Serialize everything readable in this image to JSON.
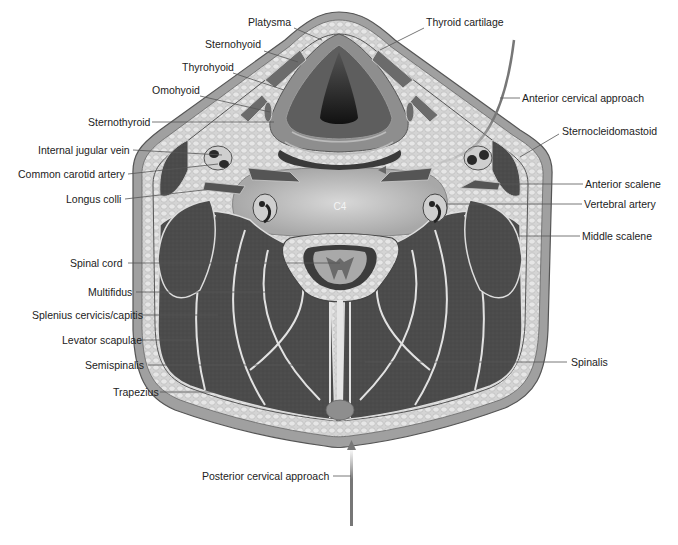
{
  "figure": {
    "vertebral_level": "C4",
    "colors": {
      "background": "#ffffff",
      "skin": "#9e9e9e",
      "fat": "#d6d6d6",
      "muscle": "#4a4a4a",
      "fascia": "#e8e8e8",
      "bone": "#c4c4c4",
      "cord": "#7a7a7a",
      "leader_line": "#555555",
      "label_text": "#222222"
    },
    "labels_left": [
      {
        "text": "Platysma",
        "x": 248,
        "y": 22
      },
      {
        "text": "Sternohyoid",
        "x": 205,
        "y": 44
      },
      {
        "text": "Thyrohyoid",
        "x": 182,
        "y": 67
      },
      {
        "text": "Omohyoid",
        "x": 152,
        "y": 90
      },
      {
        "text": "Sternothyroid",
        "x": 88,
        "y": 122
      },
      {
        "text": "Internal jugular vein",
        "x": 38,
        "y": 150
      },
      {
        "text": "Common carotid artery",
        "x": 18,
        "y": 174
      },
      {
        "text": "Longus colli",
        "x": 66,
        "y": 199
      },
      {
        "text": "Spinal cord",
        "x": 70,
        "y": 263
      },
      {
        "text": "Multifidus",
        "x": 88,
        "y": 292
      },
      {
        "text": "Splenius cervicis/capitis",
        "x": 32,
        "y": 315
      },
      {
        "text": "Levator scapulae",
        "x": 62,
        "y": 340
      },
      {
        "text": "Semispinalis",
        "x": 85,
        "y": 365
      },
      {
        "text": "Trapezius",
        "x": 113,
        "y": 392
      },
      {
        "text": "Posterior cervical approach",
        "x": 202,
        "y": 475
      }
    ],
    "labels_right": [
      {
        "text": "Thyroid cartilage",
        "x": 426,
        "y": 22
      },
      {
        "text": "Anterior cervical approach",
        "x": 522,
        "y": 98
      },
      {
        "text": "Sternocleidomastoid",
        "x": 562,
        "y": 131
      },
      {
        "text": "Anterior scalene",
        "x": 585,
        "y": 184
      },
      {
        "text": "Vertebral artery",
        "x": 584,
        "y": 204
      },
      {
        "text": "Middle scalene",
        "x": 582,
        "y": 236
      },
      {
        "text": "Spinalis",
        "x": 571,
        "y": 362
      }
    ]
  }
}
